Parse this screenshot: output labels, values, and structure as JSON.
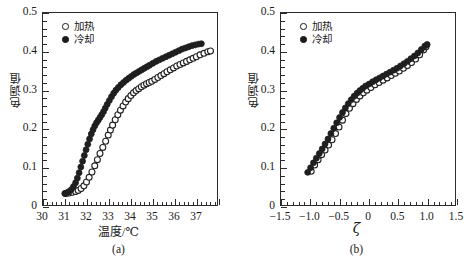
{
  "figure": {
    "panels": [
      {
        "caption": "(a)",
        "legend": [
          {
            "marker": "open-circle-icon",
            "label": "加热"
          },
          {
            "marker": "filled-circle-icon",
            "label": "冷却"
          }
        ]
      },
      {
        "caption": "(b)",
        "legend": [
          {
            "marker": "open-circle-icon",
            "label": "加热"
          },
          {
            "marker": "filled-circle-icon",
            "label": "冷却"
          }
        ]
      }
    ]
  },
  "chart_data": [
    {
      "type": "scatter",
      "panel": "(a)",
      "title": "",
      "xlabel": "温度/℃",
      "ylabel": "色调值",
      "xlim": [
        30,
        38
      ],
      "ylim": [
        0,
        0.5
      ],
      "xticks": [
        30,
        31,
        32,
        33,
        34,
        35,
        36,
        37,
        38
      ],
      "xticklabels": [
        "30",
        "31",
        "32",
        "33",
        "34",
        "35",
        "36",
        "37",
        ""
      ],
      "xminor_step": 0.2,
      "yticks": [
        0,
        0.1,
        0.2,
        0.3,
        0.4,
        0.5
      ],
      "yticklabels": [
        "0",
        "0.1",
        "0.2",
        "0.3",
        "0.4",
        "0.5"
      ],
      "yminor_step": 0.02,
      "grid": false,
      "legend_position": "upper-left",
      "series": [
        {
          "name": "加热",
          "marker": "open-circle",
          "x": [
            31.05,
            31.2,
            31.35,
            31.5,
            31.62,
            31.75,
            31.88,
            32.0,
            32.12,
            32.25,
            32.38,
            32.5,
            32.62,
            32.75,
            32.88,
            33.0,
            33.1,
            33.2,
            33.32,
            33.44,
            33.56,
            33.68,
            33.8,
            33.92,
            34.04,
            34.16,
            34.28,
            34.4,
            34.52,
            34.64,
            34.76,
            34.88,
            35.0,
            35.14,
            35.28,
            35.42,
            35.56,
            35.7,
            35.85,
            36.0,
            36.15,
            36.3,
            36.45,
            36.6,
            36.75,
            36.9,
            37.05,
            37.22,
            37.4,
            37.58,
            37.7
          ],
          "y": [
            0.03,
            0.031,
            0.033,
            0.035,
            0.038,
            0.043,
            0.05,
            0.06,
            0.072,
            0.086,
            0.102,
            0.118,
            0.134,
            0.15,
            0.166,
            0.182,
            0.195,
            0.208,
            0.222,
            0.235,
            0.247,
            0.258,
            0.268,
            0.277,
            0.285,
            0.292,
            0.298,
            0.303,
            0.308,
            0.312,
            0.316,
            0.319,
            0.322,
            0.327,
            0.332,
            0.337,
            0.342,
            0.347,
            0.352,
            0.357,
            0.362,
            0.366,
            0.37,
            0.374,
            0.378,
            0.382,
            0.386,
            0.391,
            0.395,
            0.399,
            0.401
          ]
        },
        {
          "name": "冷却",
          "marker": "filled-circle",
          "x": [
            31.0,
            31.1,
            31.2,
            31.3,
            31.4,
            31.5,
            31.58,
            31.66,
            31.74,
            31.82,
            31.9,
            31.98,
            32.06,
            32.14,
            32.22,
            32.3,
            32.38,
            32.46,
            32.54,
            32.62,
            32.7,
            32.78,
            32.86,
            32.95,
            33.05,
            33.15,
            33.25,
            33.35,
            33.46,
            33.58,
            33.7,
            33.82,
            33.94,
            34.06,
            34.18,
            34.3,
            34.42,
            34.54,
            34.66,
            34.78,
            34.9,
            35.05,
            35.2,
            35.35,
            35.5,
            35.65,
            35.8,
            35.95,
            36.1,
            36.25,
            36.4,
            36.55,
            36.7,
            36.85,
            37.0,
            37.15,
            37.28
          ],
          "y": [
            0.03,
            0.032,
            0.035,
            0.04,
            0.048,
            0.058,
            0.07,
            0.084,
            0.099,
            0.114,
            0.129,
            0.144,
            0.158,
            0.172,
            0.185,
            0.196,
            0.206,
            0.214,
            0.221,
            0.228,
            0.235,
            0.243,
            0.252,
            0.262,
            0.272,
            0.282,
            0.291,
            0.299,
            0.306,
            0.313,
            0.319,
            0.325,
            0.33,
            0.335,
            0.34,
            0.344,
            0.348,
            0.352,
            0.356,
            0.36,
            0.364,
            0.369,
            0.374,
            0.378,
            0.382,
            0.386,
            0.39,
            0.394,
            0.398,
            0.402,
            0.406,
            0.409,
            0.412,
            0.415,
            0.417,
            0.419,
            0.42
          ]
        }
      ]
    },
    {
      "type": "scatter",
      "panel": "(b)",
      "title": "",
      "xlabel": "ζ",
      "ylabel": "色调值",
      "xlim": [
        -1.5,
        1.5
      ],
      "ylim": [
        0,
        0.5
      ],
      "xticks": [
        -1.5,
        -1.0,
        -0.5,
        0,
        0.5,
        1.0,
        1.5
      ],
      "xticklabels": [
        "−1.5",
        "−1.0",
        "−0.5",
        "0",
        "0.5",
        "1.0",
        "1.5"
      ],
      "xminor_step": 0.1,
      "yticks": [
        0,
        0.1,
        0.2,
        0.3,
        0.4,
        0.5
      ],
      "yticklabels": [
        "0",
        "0.1",
        "0.2",
        "0.3",
        "0.4",
        "0.5"
      ],
      "yminor_step": 0.02,
      "grid": false,
      "legend_position": "upper-left",
      "series": [
        {
          "name": "加热",
          "marker": "open-circle",
          "x": [
            -0.98,
            -0.92,
            -0.86,
            -0.8,
            -0.74,
            -0.68,
            -0.62,
            -0.56,
            -0.5,
            -0.44,
            -0.38,
            -0.32,
            -0.26,
            -0.2,
            -0.14,
            -0.08,
            -0.02,
            0.05,
            0.12,
            0.19,
            0.26,
            0.33,
            0.4,
            0.47,
            0.54,
            0.61,
            0.68,
            0.75,
            0.82,
            0.89,
            0.96,
            1.0
          ],
          "y": [
            0.088,
            0.104,
            0.118,
            0.131,
            0.143,
            0.156,
            0.17,
            0.186,
            0.203,
            0.221,
            0.238,
            0.252,
            0.264,
            0.275,
            0.284,
            0.292,
            0.299,
            0.306,
            0.313,
            0.319,
            0.325,
            0.331,
            0.337,
            0.343,
            0.349,
            0.356,
            0.363,
            0.371,
            0.38,
            0.391,
            0.404,
            0.412
          ]
        },
        {
          "name": "冷却",
          "marker": "filled-circle",
          "x": [
            -1.04,
            -0.99,
            -0.94,
            -0.89,
            -0.84,
            -0.79,
            -0.74,
            -0.69,
            -0.64,
            -0.59,
            -0.54,
            -0.49,
            -0.44,
            -0.39,
            -0.34,
            -0.29,
            -0.24,
            -0.19,
            -0.14,
            -0.09,
            -0.04,
            0.02,
            0.08,
            0.14,
            0.2,
            0.26,
            0.32,
            0.38,
            0.44,
            0.5,
            0.56,
            0.62,
            0.68,
            0.74,
            0.8,
            0.86,
            0.92,
            0.98,
            1.02
          ],
          "y": [
            0.085,
            0.097,
            0.11,
            0.122,
            0.134,
            0.146,
            0.159,
            0.172,
            0.186,
            0.2,
            0.214,
            0.228,
            0.241,
            0.253,
            0.264,
            0.274,
            0.283,
            0.291,
            0.298,
            0.304,
            0.31,
            0.315,
            0.321,
            0.326,
            0.331,
            0.336,
            0.341,
            0.346,
            0.351,
            0.356,
            0.362,
            0.368,
            0.374,
            0.381,
            0.388,
            0.396,
            0.405,
            0.414,
            0.418
          ]
        }
      ]
    }
  ]
}
